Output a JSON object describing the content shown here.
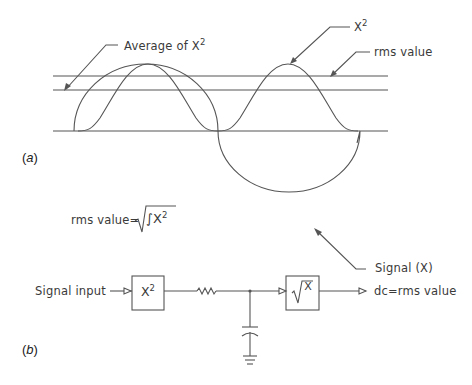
{
  "figure": {
    "panel_a": {
      "label_open": "(",
      "label_letter": "a",
      "label_close": ")",
      "annotations": {
        "average": {
          "text": "Average of X",
          "sup": "2"
        },
        "x_squared": {
          "text": "X",
          "sup": "2"
        },
        "rms": {
          "text": "rms value"
        },
        "signal": {
          "text": "Signal (X)"
        }
      },
      "formula": {
        "lhs": "rms value=",
        "radicand": "∫X",
        "sup": "2"
      }
    },
    "panel_b": {
      "label_open": "(",
      "label_letter": "b",
      "label_close": ")",
      "input_label": "Signal input",
      "block1": {
        "text": "X",
        "sup": "2"
      },
      "block2": {
        "text": "X"
      },
      "output_label": "dc=rms value"
    },
    "colors": {
      "line": "#555555",
      "text": "#3a3a3a",
      "background": "#ffffff"
    }
  }
}
